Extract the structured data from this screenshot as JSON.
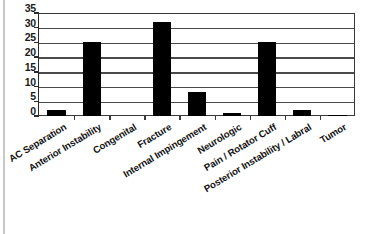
{
  "chart_data": {
    "type": "bar",
    "title": "",
    "subtitle": "",
    "xlabel": "",
    "ylabel": "",
    "categories": [
      "AC Separation",
      "Anterior Instability",
      "Congenital",
      "Fracture",
      "Internal Impingement",
      "Neurologic",
      "Pain / Rotator Cuff",
      "Posterior Instability / Labral",
      "Tumor"
    ],
    "values": [
      2,
      25,
      0,
      32,
      8,
      1,
      25,
      2,
      0.5
    ],
    "ylim": [
      0,
      35
    ],
    "yticks": [
      0,
      5,
      10,
      15,
      20,
      25,
      30,
      35
    ],
    "ytick_labels": [
      "0",
      "5",
      "10",
      "15",
      "20",
      "25",
      "30",
      "35"
    ],
    "grid": true,
    "grid_axis": "y",
    "legend": false,
    "legend_position": "none",
    "bar_color": "#000000",
    "gridline_color": "#4a4a4a",
    "frame_color": "#3a3a3a",
    "axis_text_color": "#1a1a1a",
    "background_color": "#ffffff",
    "category_label_rotation": -31
  }
}
